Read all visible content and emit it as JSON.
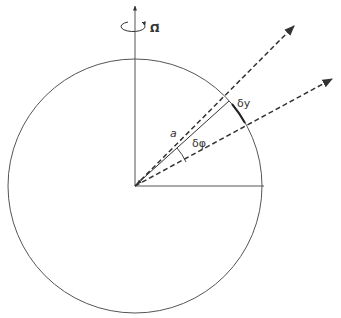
{
  "diagram": {
    "labels": {
      "omega": "Ω⃗",
      "radius": "a",
      "dphi": "δφ",
      "dy": "δy"
    },
    "colors": {
      "line": "#555555",
      "dashed": "#333333",
      "background": "#ffffff"
    },
    "geometry": {
      "center": [
        135,
        186
      ],
      "radius": 127,
      "axis_top": [
        135,
        4
      ],
      "horizontal_end": [
        264,
        186
      ],
      "ray_upper_tip": [
        295,
        25
      ],
      "ray_lower_tip": [
        333,
        78
      ]
    }
  }
}
